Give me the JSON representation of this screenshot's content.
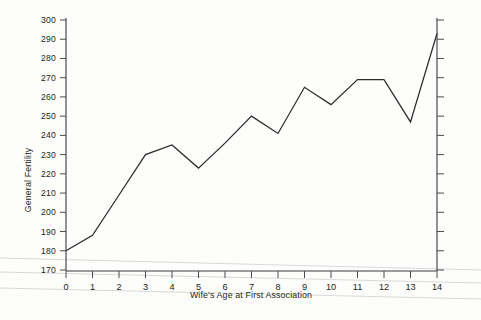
{
  "chart_data": {
    "type": "line",
    "title": "",
    "subtitle": "",
    "xlabel": "Wife's Age at First Association",
    "ylabel": "General Fertility",
    "x": [
      0,
      1,
      2,
      3,
      4,
      5,
      6,
      7,
      8,
      9,
      10,
      11,
      12,
      13,
      14
    ],
    "values": [
      180,
      188,
      209,
      230,
      235,
      223,
      236,
      250,
      241,
      265,
      256,
      269,
      269,
      247,
      293
    ],
    "series": [
      {
        "name": "General Fertility",
        "values": [
          180,
          188,
          209,
          230,
          235,
          223,
          236,
          250,
          241,
          265,
          256,
          269,
          269,
          247,
          293
        ]
      }
    ],
    "xlim": [
      0,
      14
    ],
    "ylim": [
      170,
      300
    ],
    "xticks": [
      0,
      1,
      2,
      3,
      4,
      5,
      6,
      7,
      8,
      9,
      10,
      11,
      12,
      13,
      14
    ],
    "xtick_labels": [
      "0",
      "1",
      "2",
      "3",
      "4",
      "5",
      "6",
      "7",
      "8",
      "9",
      "10",
      "11",
      "12",
      "13",
      "14"
    ],
    "yticks": [
      170,
      180,
      190,
      200,
      210,
      220,
      230,
      240,
      250,
      260,
      270,
      280,
      290,
      300
    ],
    "ytick_labels": [
      "170",
      "180",
      "190",
      "200",
      "210",
      "220",
      "230",
      "240",
      "250",
      "260",
      "270",
      "280",
      "290",
      "300"
    ],
    "grid": false,
    "legend": null,
    "legend_position": "none",
    "line_color": "#2b2b2b",
    "axis_color": "#3a3a3a",
    "background_color": "#fdfdfc",
    "annotations": [],
    "right_axis": {
      "visible": true,
      "ticks": [
        170,
        180,
        190,
        200,
        210,
        220,
        230,
        240,
        250,
        260,
        270,
        280,
        290,
        300
      ],
      "labels_shown": false
    }
  }
}
